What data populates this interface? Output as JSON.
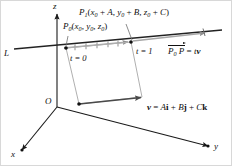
{
  "figure": {
    "colors": {
      "ink": "#111111",
      "axis": "#1a1a1a",
      "line_L": "#222222",
      "gray_guide": "#9a9a9a",
      "gray_light": "#b5b5b5",
      "vector_dark": "#4a4a4a",
      "background": "#ffffff",
      "border": "#cfcfcf"
    },
    "axes": [
      {
        "id": "z",
        "label": "z"
      },
      {
        "id": "y",
        "label": "y"
      },
      {
        "id": "x",
        "label": "x"
      }
    ],
    "origin_label": "O",
    "line_label": "L",
    "points": [
      {
        "id": "P0",
        "name": "P-zero",
        "label_main": "P",
        "label_sub": "0",
        "label_coords": "(x0, y0, z0)",
        "coord_parts": [
          "x",
          "0",
          ", ",
          "y",
          "0",
          ", ",
          "z",
          "0"
        ]
      },
      {
        "id": "P1",
        "name": "P-one",
        "label_main": "P",
        "label_sub": "1",
        "label_coords": "(x0 + A, y0 + B, z0 + C)"
      }
    ],
    "parameter_marks": [
      {
        "id": "t0",
        "label": "t",
        "equals": "= 0",
        "full": "t = 0"
      },
      {
        "id": "t1",
        "label": "t",
        "equals": "= 1",
        "full": "t = 1"
      }
    ],
    "vector_equations": [
      {
        "id": "displacement",
        "text": "P0P = tv",
        "prefix_vec": "P",
        "prefix_sub": "0",
        "prefix_vec2": "P",
        "rhs": "= t",
        "rhs_bold": "v"
      },
      {
        "id": "direction",
        "text": "v = Ai + Bj + Ck",
        "lhs": "v",
        "eq": "=",
        "terms": [
          "A",
          "i",
          "+",
          "B",
          "j",
          "+",
          "C",
          "k"
        ]
      }
    ],
    "point_marker_label": "P",
    "tick_count_between": 5
  }
}
